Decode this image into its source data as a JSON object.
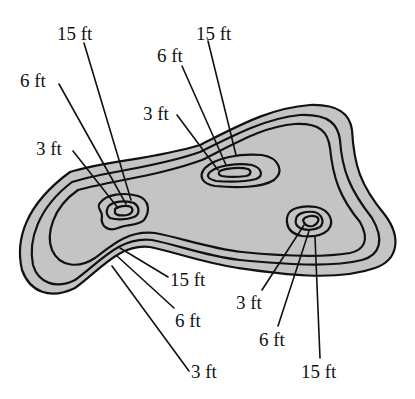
{
  "diagram": {
    "type": "pool depth contour map",
    "fill_color": "#c4c4c4",
    "line_color": "#111111",
    "labels": {
      "upper_left_15": "15 ft",
      "upper_left_6": "6 ft",
      "upper_left_3": "3 ft",
      "upper_mid_15": "15 ft",
      "upper_mid_6": "6 ft",
      "upper_mid_3": "3 ft",
      "lower_left_15": "15 ft",
      "lower_left_6": "6 ft",
      "lower_left_3": "3 ft",
      "lower_right_3": "3 ft",
      "lower_right_6": "6 ft",
      "lower_right_15": "15 ft"
    },
    "depth_levels": [
      "3 ft",
      "6 ft",
      "15 ft"
    ]
  }
}
